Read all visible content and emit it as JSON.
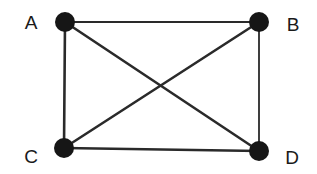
{
  "diagram": {
    "type": "complete-graph",
    "colors": {
      "background": "#ffffff",
      "node": "#161616",
      "edge": "#2a2a2a",
      "label": "#1a1a1a"
    },
    "nodes": [
      {
        "id": "A",
        "label": "A",
        "x": 65,
        "y": 22,
        "label_x": 31,
        "label_y": 29
      },
      {
        "id": "B",
        "label": "B",
        "x": 259,
        "y": 22,
        "label_x": 293,
        "label_y": 31
      },
      {
        "id": "C",
        "label": "C",
        "x": 64,
        "y": 148,
        "label_x": 31,
        "label_y": 163
      },
      {
        "id": "D",
        "label": "D",
        "x": 259,
        "y": 151,
        "label_x": 292,
        "label_y": 164
      }
    ],
    "edges": [
      {
        "from": "A",
        "to": "B"
      },
      {
        "from": "A",
        "to": "C"
      },
      {
        "from": "A",
        "to": "D"
      },
      {
        "from": "B",
        "to": "C"
      },
      {
        "from": "B",
        "to": "D"
      },
      {
        "from": "C",
        "to": "D"
      }
    ]
  }
}
